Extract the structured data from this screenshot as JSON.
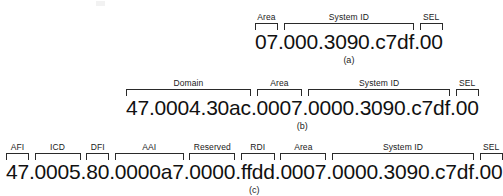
{
  "figure": {
    "title_caption_style": "(a) (b) (c)",
    "rows": [
      {
        "id": "a",
        "caption": "(a)",
        "address": "07.000.3090.c7df.00",
        "segments": [
          {
            "label": "Area",
            "value": "07",
            "bracketed": true,
            "sep_after": "."
          },
          {
            "label": "System ID",
            "value": "000.3090.c7df",
            "bracketed": true,
            "sep_after": "."
          },
          {
            "label": "SEL",
            "value": "00",
            "bracketed": true,
            "sep_after": ""
          }
        ]
      },
      {
        "id": "b",
        "caption": "(b)",
        "address": "47.0004.30ac.0007.0000.3090.c7df.00",
        "segments": [
          {
            "label": "Domain",
            "value": "47.0004.30ac",
            "bracketed": true,
            "sep_after": "."
          },
          {
            "label": "Area",
            "value": "0007",
            "bracketed": true,
            "sep_after": "."
          },
          {
            "label": "System ID",
            "value": "0000.3090.c7df",
            "bracketed": true,
            "sep_after": "."
          },
          {
            "label": "SEL",
            "value": "00",
            "bracketed": true,
            "sep_after": ""
          }
        ]
      },
      {
        "id": "c",
        "caption": "(c)",
        "address": "47.0005.80.0000a7.0000.ffdd.0007.0000.3090.c7df.00",
        "segments": [
          {
            "label": "AFI",
            "value": "47",
            "bracketed": true,
            "sep_after": "."
          },
          {
            "label": "ICD",
            "value": "0005",
            "bracketed": true,
            "sep_after": "."
          },
          {
            "label": "DFI",
            "value": "80",
            "bracketed": true,
            "sep_after": "."
          },
          {
            "label": "AAI",
            "value": "0000a7",
            "bracketed": true,
            "sep_after": "."
          },
          {
            "label": "Reserved",
            "value": "0000",
            "bracketed": true,
            "sep_after": "."
          },
          {
            "label": "RDI",
            "value": "ffdd",
            "bracketed": true,
            "sep_after": "."
          },
          {
            "label": "Area",
            "value": "0007",
            "bracketed": true,
            "sep_after": "."
          },
          {
            "label": "System ID",
            "value": "0000.3090.c7df",
            "bracketed": true,
            "sep_after": "."
          },
          {
            "label": "SEL",
            "value": "00",
            "bracketed": true,
            "sep_after": ""
          }
        ]
      }
    ],
    "colors": {
      "background": "#ffffff",
      "text": "#111111",
      "bracket": "#2a2a2a"
    }
  }
}
